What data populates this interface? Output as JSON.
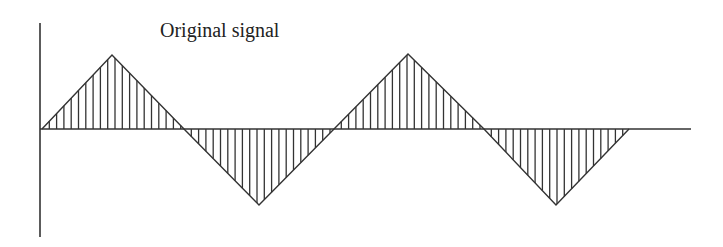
{
  "title": "Original signal",
  "colors": {
    "stroke": "#333333",
    "text": "#222222",
    "background": "#ffffff"
  },
  "axes": {
    "y_axis": {
      "x": 40,
      "y_top": 23,
      "y_bottom": 237
    },
    "x_axis": {
      "y": 129,
      "x_start": 40,
      "x_end": 691
    }
  },
  "signal": {
    "type": "triangle_wave_sampled",
    "sample_spacing_px": 7.3,
    "segments": [
      {
        "kind": "peak",
        "x_start": 42,
        "x_apex": 112,
        "x_end": 184,
        "apex_y": 55
      },
      {
        "kind": "trough",
        "x_start": 184,
        "x_apex": 259,
        "x_end": 334,
        "apex_y": 205
      },
      {
        "kind": "peak",
        "x_start": 334,
        "x_apex": 408,
        "x_end": 484,
        "apex_y": 54
      },
      {
        "kind": "trough",
        "x_start": 484,
        "x_apex": 556,
        "x_end": 629,
        "apex_y": 205
      }
    ]
  },
  "label_pos": {
    "x": 160,
    "y": 20
  }
}
